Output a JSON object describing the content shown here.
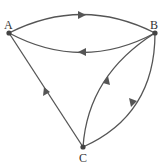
{
  "diagram": {
    "type": "directed-graph",
    "nodes": [
      {
        "id": "A",
        "label": "A",
        "x": 9,
        "y": 33
      },
      {
        "id": "B",
        "label": "B",
        "x": 155,
        "y": 33
      },
      {
        "id": "C",
        "label": "C",
        "x": 83,
        "y": 147
      }
    ],
    "edges": [
      {
        "from": "A",
        "to": "B",
        "shape": "upper-arc"
      },
      {
        "from": "B",
        "to": "A",
        "shape": "lower-arc"
      },
      {
        "from": "C",
        "to": "A",
        "shape": "straight"
      },
      {
        "from": "C",
        "to": "B",
        "shape": "inner-arc"
      },
      {
        "from": "B",
        "to": "C",
        "shape": "outer-arc"
      }
    ],
    "colors": {
      "stroke": "#555555",
      "node": "#444444",
      "label": "#333333"
    }
  }
}
